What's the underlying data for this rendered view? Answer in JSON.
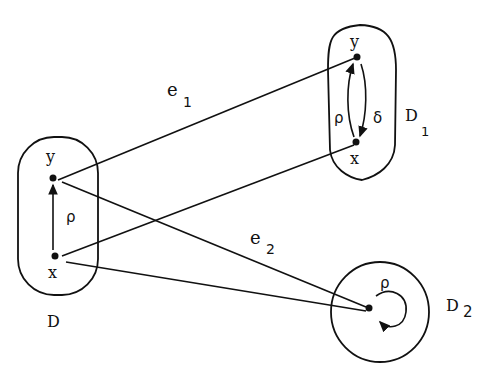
{
  "domains": {
    "D": {
      "label": "D",
      "subscript": ""
    },
    "D1": {
      "label": "D",
      "subscript": "1"
    },
    "D2": {
      "label": "D",
      "subscript": "2"
    }
  },
  "nodes": {
    "D_y": "y",
    "D_x": "x",
    "D1_y": "y",
    "D1_x": "x"
  },
  "relations": {
    "D_rho": "ρ",
    "D1_rho": "ρ",
    "D1_delta": "δ",
    "D2_rho": "ρ"
  },
  "edges": {
    "e1": {
      "label": "e",
      "subscript": "1"
    },
    "e2": {
      "label": "e",
      "subscript": "2"
    }
  },
  "colors": {
    "ink": "#111111",
    "background": "#ffffff"
  }
}
